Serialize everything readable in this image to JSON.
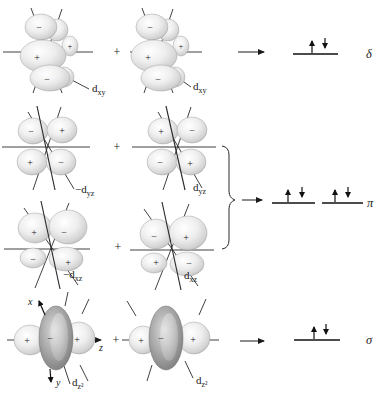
{
  "figure": {
    "background": "#ffffff",
    "ink_color": "#1a1a1a",
    "plus": "+",
    "axes": {
      "x": "x",
      "y": "y",
      "z": "z"
    },
    "rows": [
      {
        "bond": "δ",
        "orbitals": [
          {
            "label": {
              "main": "d",
              "sub": "xy"
            },
            "signs": [
              "−",
              "+",
              "+",
              "−"
            ]
          },
          {
            "label": {
              "main": "d",
              "sub": "xy"
            },
            "signs": [
              "−",
              "+",
              "+",
              "−"
            ]
          }
        ],
        "result_level": {
          "spins": [
            "up",
            "down"
          ]
        }
      },
      {
        "bond": "π",
        "orbitals": [
          {
            "label": {
              "main": "−d",
              "sub": "yz"
            },
            "signs": [
              "−",
              "+",
              "+",
              "−"
            ]
          },
          {
            "label": {
              "main": "d",
              "sub": "yz"
            },
            "signs": [
              "+",
              "−",
              "−",
              "+"
            ]
          }
        ],
        "result_levels": [
          {
            "spins": [
              "up",
              "down"
            ]
          },
          {
            "spins": [
              "up",
              "down"
            ]
          }
        ]
      },
      {
        "orbitals": [
          {
            "label": {
              "main": "−d",
              "sub": "xz"
            },
            "signs": [
              "+",
              "−",
              "−",
              "+"
            ]
          },
          {
            "label": {
              "main": "d",
              "sub": "xz"
            },
            "signs": [
              "−",
              "+",
              "+",
              "−"
            ]
          }
        ]
      },
      {
        "bond": "σ",
        "orbitals": [
          {
            "label": {
              "main": "d",
              "sub": "z²"
            },
            "signs": [
              "+",
              "−",
              "+"
            ]
          },
          {
            "label": {
              "main": "d",
              "sub": "z²"
            },
            "signs": [
              "+",
              "−",
              "+"
            ]
          }
        ],
        "result_level": {
          "spins": [
            "up",
            "down"
          ]
        }
      }
    ]
  }
}
